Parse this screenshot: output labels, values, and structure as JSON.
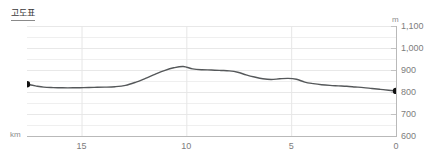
{
  "title": "고도표",
  "axes": {
    "y_unit": "m",
    "x_unit": "km",
    "y_ticks": [
      "1,100",
      "1,000",
      "900",
      "800",
      "700",
      "600"
    ],
    "x_ticks": [
      "15",
      "10",
      "5",
      "0"
    ]
  },
  "colors": {
    "line": "#55585a",
    "marker": "#111111",
    "grid": "#efefef",
    "axis": "#b9b9b9",
    "text": "#7d7d7d",
    "title": "#3a3a3a",
    "background": "#ffffff"
  },
  "chart_data": {
    "type": "area",
    "title": "고도표",
    "xlabel": "km",
    "ylabel": "m",
    "xlim": [
      17.6,
      0
    ],
    "ylim": [
      600,
      1100
    ],
    "x_reversed": true,
    "grid": true,
    "legend": null,
    "y_major_step": 100,
    "y_minor_step": 50,
    "start_marker": {
      "x": 17.6,
      "y": 835
    },
    "end_marker": {
      "x": 0.0,
      "y": 805
    },
    "series": [
      {
        "name": "elevation",
        "x": [
          17.6,
          17.2,
          16.8,
          16.35,
          15.9,
          15.4,
          14.9,
          14.4,
          13.9,
          13.4,
          12.9,
          12.4,
          11.95,
          11.5,
          11.05,
          10.6,
          10.15,
          9.7,
          9.25,
          8.8,
          8.35,
          7.95,
          7.55,
          7.15,
          6.75,
          6.35,
          5.95,
          5.55,
          5.15,
          4.75,
          4.35,
          3.95,
          3.55,
          3.15,
          2.75,
          2.35,
          1.95,
          1.55,
          1.15,
          0.75,
          0.35,
          0.0
        ],
        "y": [
          835,
          828,
          822,
          820,
          819,
          819,
          820,
          821,
          822,
          824,
          830,
          845,
          862,
          880,
          897,
          910,
          916,
          905,
          901,
          900,
          898,
          896,
          890,
          878,
          868,
          860,
          857,
          860,
          862,
          858,
          845,
          838,
          833,
          830,
          828,
          826,
          823,
          820,
          816,
          812,
          808,
          805
        ],
        "unit": "m"
      }
    ]
  }
}
